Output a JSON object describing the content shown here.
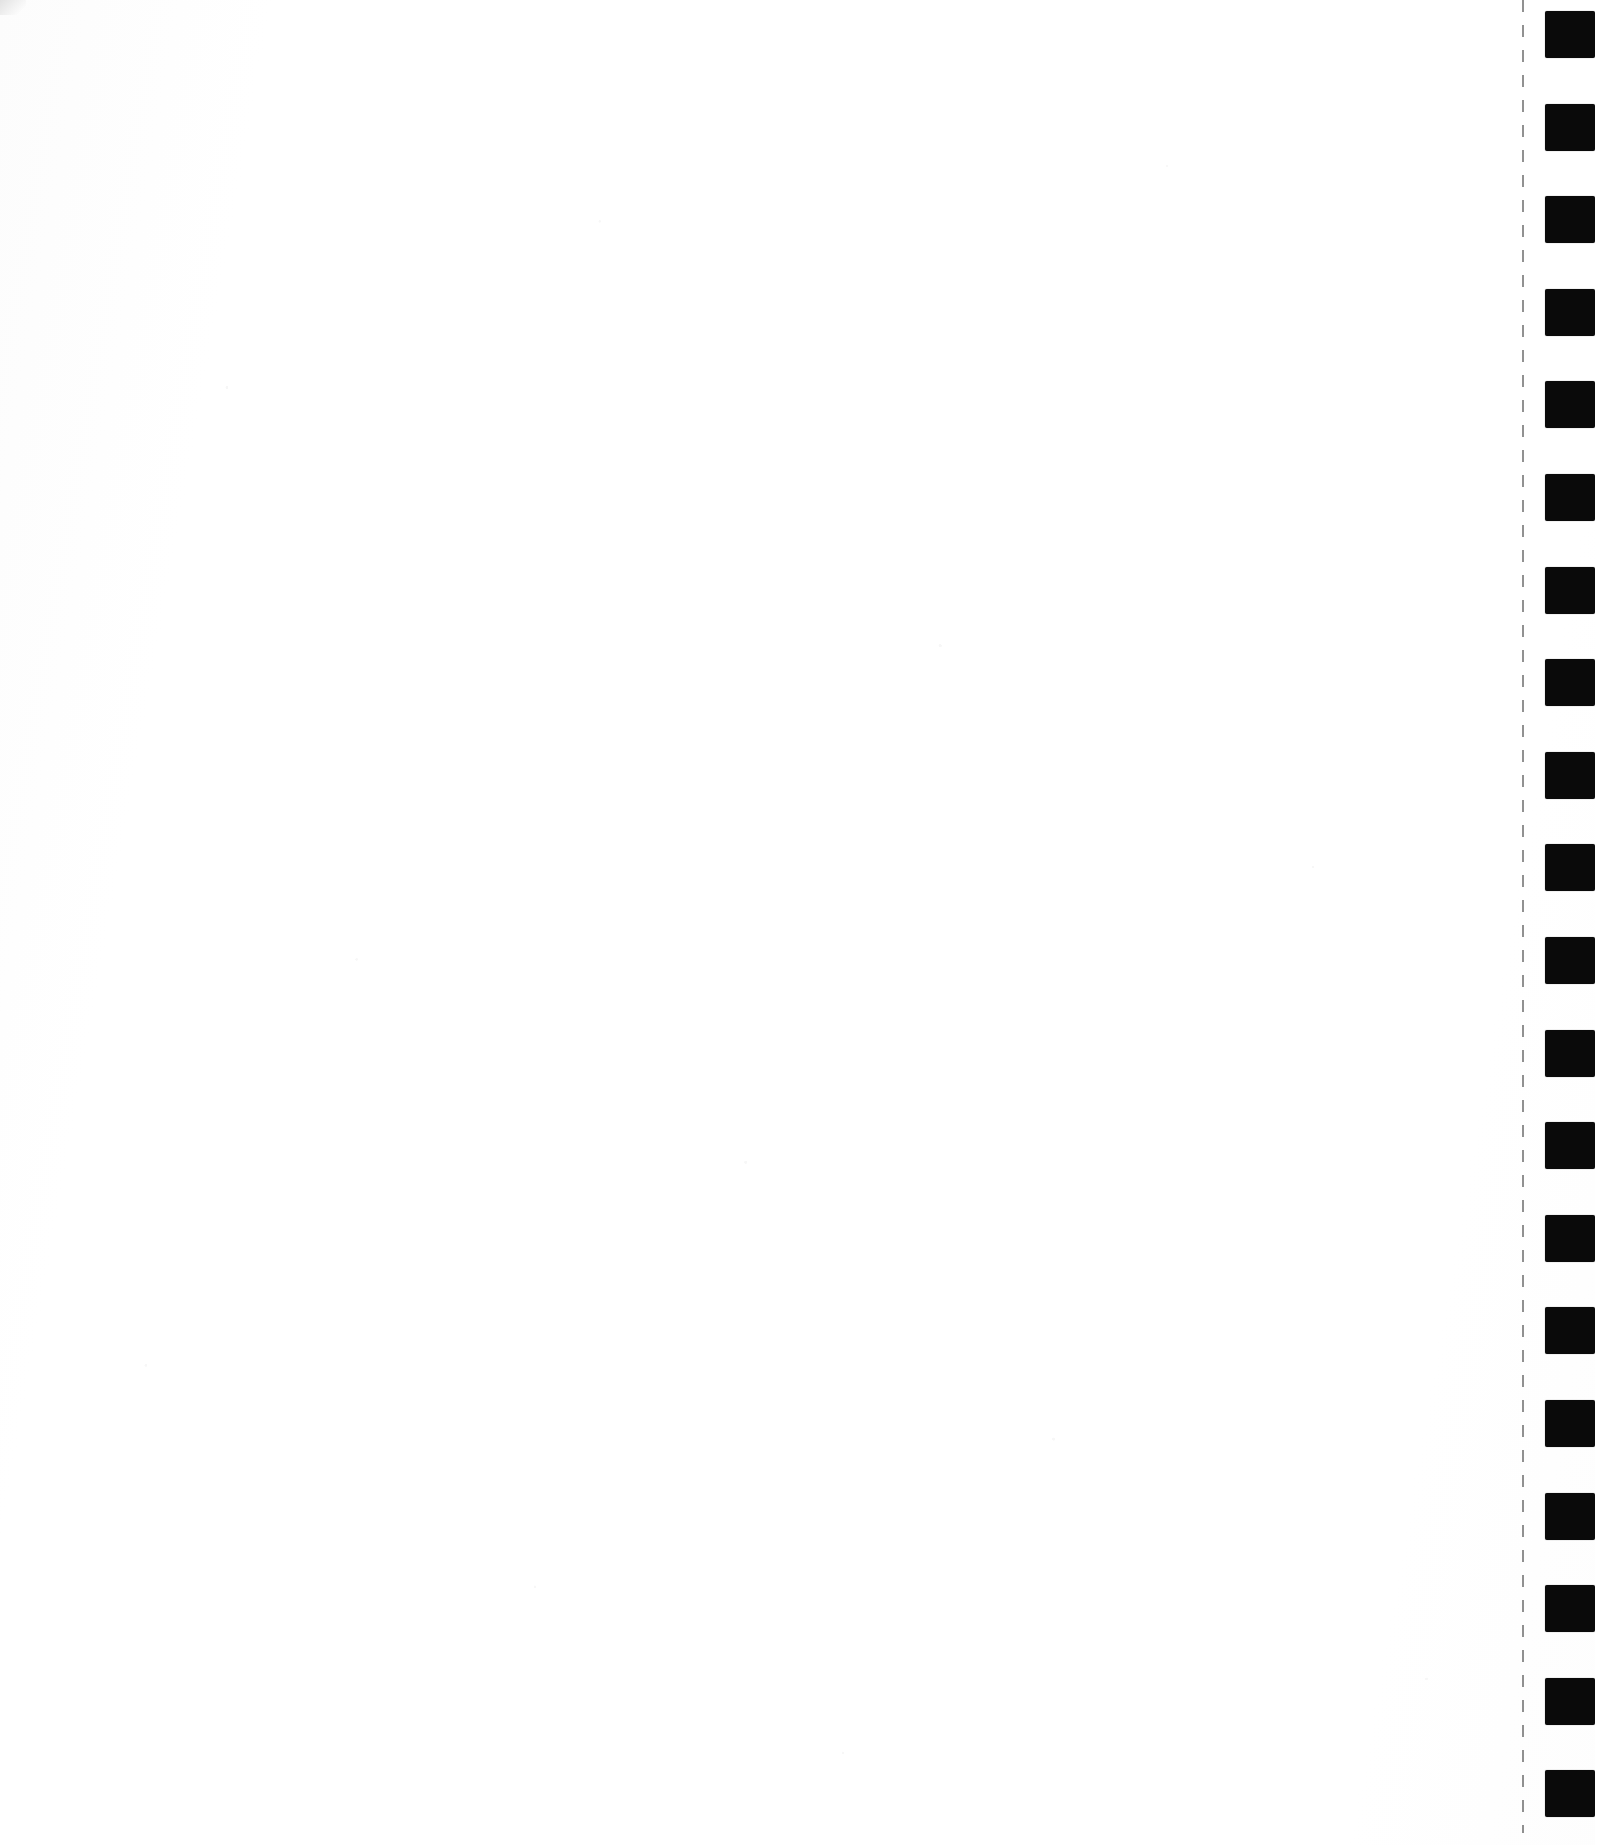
{
  "document": {
    "kind": "scanned-page",
    "page_label": "",
    "body_text": "",
    "width_px": 1621,
    "height_px": 1845,
    "background_color": "#ffffff",
    "paper_tone": "#fdfdfd"
  },
  "tear_strip": {
    "name": "perforated-edge",
    "perforation_line": {
      "color": "#7d7d7d",
      "x_px": 1522,
      "thickness_px": 2,
      "dash_length_px": 12,
      "dash_gap_px": 13,
      "top_px": 0,
      "bottom_px": 1833
    },
    "registration_marks": {
      "color": "#0a0a0a",
      "count": 20,
      "width_px": 50,
      "height_px": 47,
      "left_px": 1545,
      "first_top_px": 11,
      "spacing_px": 92.6,
      "tops_px": [
        11,
        103.6,
        196.2,
        288.8,
        381.4,
        474,
        566.6,
        659.2,
        751.8,
        844.4,
        937,
        1029.6,
        1122.2,
        1214.8,
        1307.4,
        1400,
        1492.6,
        1585.2,
        1677.8,
        1770.4
      ]
    },
    "right_margin": {
      "left_px": 1595,
      "width_px": 26,
      "color": "#ffffff"
    }
  },
  "corner": {
    "name": "top-left-scan-shadow",
    "color": "#d9d9d9"
  }
}
